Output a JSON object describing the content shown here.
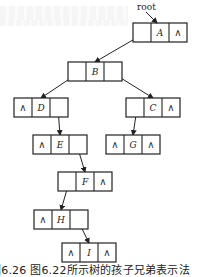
{
  "diagram": {
    "type": "binary-linked-list-tree",
    "pointer_label": "root",
    "null_symbol": "∧",
    "nodes": [
      {
        "id": "A",
        "x": 133,
        "y": 23,
        "left": "",
        "data": "A",
        "right": "∧"
      },
      {
        "id": "B",
        "x": 68,
        "y": 62,
        "left": "",
        "data": "B",
        "right": ""
      },
      {
        "id": "D",
        "x": 14,
        "y": 98,
        "left": "∧",
        "data": "D",
        "right": ""
      },
      {
        "id": "C",
        "x": 126,
        "y": 98,
        "left": "",
        "data": "C",
        "right": "∧"
      },
      {
        "id": "E",
        "x": 33,
        "y": 135,
        "left": "∧",
        "data": "E",
        "right": ""
      },
      {
        "id": "G",
        "x": 106,
        "y": 135,
        "left": "∧",
        "data": "G",
        "right": "∧"
      },
      {
        "id": "F",
        "x": 58,
        "y": 172,
        "left": "",
        "data": "F",
        "right": "∧"
      },
      {
        "id": "H",
        "x": 34,
        "y": 210,
        "left": "∧",
        "data": "H",
        "right": ""
      },
      {
        "id": "I",
        "x": 62,
        "y": 243,
        "left": "∧",
        "data": "I",
        "right": "∧"
      }
    ],
    "edges": [
      {
        "from": "A",
        "port": "left",
        "to": "B"
      },
      {
        "from": "B",
        "port": "left",
        "to": "D"
      },
      {
        "from": "B",
        "port": "right",
        "to": "C"
      },
      {
        "from": "D",
        "port": "right",
        "to": "E"
      },
      {
        "from": "C",
        "port": "left",
        "to": "G"
      },
      {
        "from": "E",
        "port": "right",
        "to": "F"
      },
      {
        "from": "F",
        "port": "left",
        "to": "H"
      },
      {
        "from": "H",
        "port": "right",
        "to": "I"
      }
    ],
    "caption": "图6.26  图6.22所示树的孩子兄弟表示法"
  }
}
